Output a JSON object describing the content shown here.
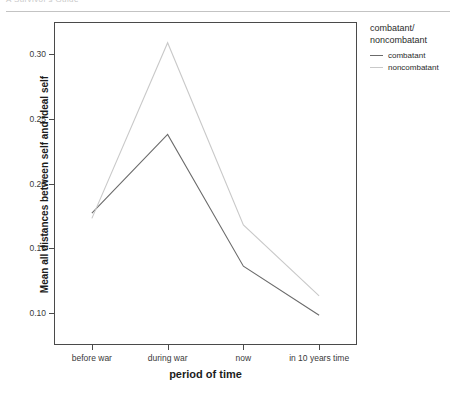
{
  "page_header": {
    "text": "A Survivor's Guide"
  },
  "chart_data": {
    "type": "line",
    "title": "",
    "xlabel": "period of time",
    "ylabel": "Mean all distances between self and ideal self",
    "categories": [
      "before war",
      "during war",
      "now",
      "in 10 years time"
    ],
    "series": [
      {
        "name": "combatant",
        "values": [
          0.177,
          0.238,
          0.136,
          0.098
        ],
        "color": "#6b6b6b"
      },
      {
        "name": "noncombatant",
        "values": [
          0.173,
          0.309,
          0.168,
          0.113
        ],
        "color": "#c9c9c9"
      }
    ],
    "ylim": [
      0.075,
      0.325
    ],
    "yticks": [
      0.1,
      0.15,
      0.2,
      0.25,
      0.3
    ],
    "ytick_labels": [
      "0.10",
      "0.15",
      "0.20",
      "0.25",
      "0.30"
    ],
    "grid": false,
    "legend_position": "right",
    "legend_title": "combatant/\nnoncombatant"
  },
  "legend": {
    "title_line1": "combatant/",
    "title_line2": "noncombatant",
    "entries": [
      {
        "label": "combatant"
      },
      {
        "label": "noncombatant"
      }
    ]
  }
}
